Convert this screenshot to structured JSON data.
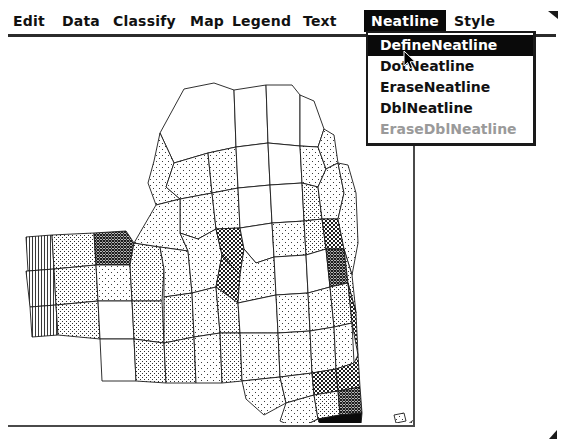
{
  "window": {
    "title": "Map Document"
  },
  "menubar": {
    "items": [
      {
        "label": "Edit",
        "x": 14,
        "active": false
      },
      {
        "label": "Data",
        "x": 62,
        "active": false
      },
      {
        "label": "Classify",
        "x": 113,
        "active": false
      },
      {
        "label": "Map",
        "x": 190,
        "active": false
      },
      {
        "label": "Legend",
        "x": 232,
        "active": false
      },
      {
        "label": "Text",
        "x": 303,
        "active": false
      },
      {
        "label": "Neatline",
        "x": 358,
        "active": true
      },
      {
        "label": "Style",
        "x": 444,
        "active": false
      }
    ]
  },
  "dropdown": {
    "owner": "Neatline",
    "items": [
      {
        "label": "DefineNeatline",
        "state": "selected"
      },
      {
        "label": "DotNeatline",
        "state": "normal"
      },
      {
        "label": "EraseNeatline",
        "state": "normal"
      },
      {
        "label": "DblNeatline",
        "state": "normal"
      },
      {
        "label": "EraseDblNeatline",
        "state": "disabled"
      }
    ]
  },
  "map": {
    "name": "new-york-state-counties",
    "region": "New York State",
    "symbology": "dithered-halftone-choropleth",
    "classes": [
      {
        "name": "lowest",
        "fill": "#ffffff"
      },
      {
        "name": "low",
        "fill": "dot-sparse"
      },
      {
        "name": "medium",
        "fill": "dot-medium"
      },
      {
        "name": "high",
        "fill": "crosshatch"
      },
      {
        "name": "highest",
        "fill": "#000000"
      }
    ]
  },
  "colors": {
    "ink": "#111111",
    "highlight_bg": "#0a0a0a",
    "highlight_fg": "#ffffff",
    "disabled_fg": "#9a9a9a",
    "frame": "#4a4a4a",
    "paper": "#ffffff"
  },
  "cursor": {
    "icon": "arrow-pointer",
    "over": "DotNeatline"
  }
}
